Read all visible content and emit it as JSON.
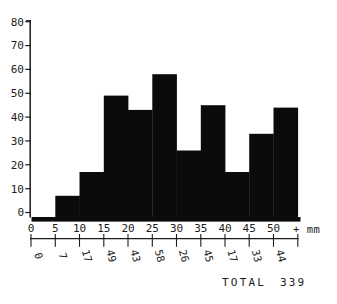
{
  "chart_data": {
    "type": "bar",
    "title": "",
    "xlabel": "mm",
    "ylabel": "",
    "categories": [
      "0-5",
      "5-10",
      "10-15",
      "15-20",
      "20-25",
      "25-30",
      "30-35",
      "35-40",
      "40-45",
      "45-50",
      "50+"
    ],
    "values": [
      0,
      7,
      17,
      49,
      43,
      58,
      26,
      45,
      17,
      33,
      44
    ],
    "bin_width_mm": 5,
    "x_ticks": [
      0,
      5,
      10,
      15,
      20,
      25,
      30,
      35,
      40,
      45,
      50
    ],
    "y_ticks": [
      0,
      10,
      20,
      30,
      40,
      50,
      60,
      70,
      80
    ],
    "xlim_mm": [
      0,
      55
    ],
    "ylim": [
      0,
      80
    ],
    "grid": false,
    "legend": "none",
    "bar_color": "#0b0b0b",
    "axis_color": "#1c1c1c",
    "overflow_unit_label": "+ mm",
    "total": 339,
    "total_label": "TOTAL 339"
  }
}
